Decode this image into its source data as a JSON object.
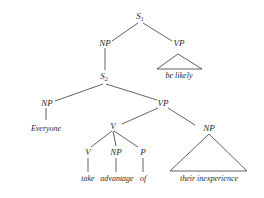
{
  "diagram": {
    "type": "syntax-tree",
    "line_color": "#3a3a3a",
    "nodes": {
      "s1": {
        "label": "S",
        "sub": "1"
      },
      "np_top": {
        "label": "NP"
      },
      "vp_top": {
        "label": "VP"
      },
      "be_likely": {
        "label": "be likely"
      },
      "s2": {
        "label": "S",
        "sub": "2"
      },
      "np_subj": {
        "label": "NP"
      },
      "everyone": {
        "label": "Everyone"
      },
      "vp_main": {
        "label": "VP"
      },
      "v_complex": {
        "label": "V"
      },
      "np_obj": {
        "label": "NP"
      },
      "v_take": {
        "label": "V"
      },
      "np_adv": {
        "label": "NP"
      },
      "p_of": {
        "label": "P"
      },
      "take": {
        "label": "take"
      },
      "advantage": {
        "label": "advantage"
      },
      "of": {
        "label": "of"
      },
      "their_inexperience": {
        "label": "their inexperience"
      }
    }
  }
}
